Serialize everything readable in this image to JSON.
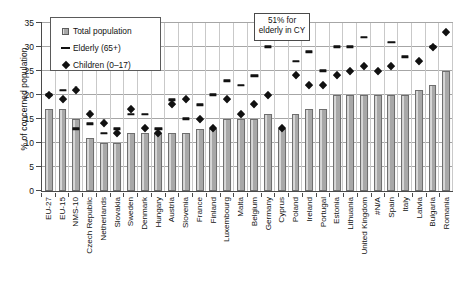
{
  "chart_data": {
    "type": "bar",
    "title": "",
    "xlabel": "",
    "ylabel": "% of concerned population",
    "ylim": [
      0,
      35
    ],
    "yticks": [
      0,
      5,
      10,
      15,
      20,
      25,
      30,
      35
    ],
    "grid": true,
    "legend_position": "top-left",
    "annotation": "51% for elderly in CY",
    "categories": [
      "EU-27",
      "EU-15",
      "NMS-10",
      "Czech Republic",
      "Netherlands",
      "Slovakia",
      "Sweden",
      "Denmark",
      "Hungary",
      "Austria",
      "Slovenia",
      "France",
      "Finland",
      "Luxembourg",
      "Malta",
      "Belgium",
      "Germany",
      "Cyprus",
      "Poland",
      "Ireland",
      "Portugal",
      "Estonia",
      "Lithuania",
      "United Kingdom",
      "#N/A",
      "Spain",
      "Italy",
      "Latvia",
      "Bulgaria",
      "Romania"
    ],
    "series": [
      {
        "name": "Total population",
        "marker": "bar",
        "values": [
          17,
          17,
          15,
          11,
          10,
          10,
          12,
          12,
          12,
          12,
          12,
          13,
          13,
          15,
          15,
          15,
          16,
          13,
          16,
          17,
          17,
          20,
          20,
          20,
          20,
          20,
          20,
          21,
          22,
          25
        ]
      },
      {
        "name": "Elderly (65+)",
        "marker": "dash",
        "values": [
          20,
          21,
          13,
          14,
          12,
          13,
          16,
          16,
          13,
          19,
          15,
          18,
          20,
          23,
          22,
          24,
          30,
          51,
          27,
          29,
          25,
          30,
          30,
          32,
          null,
          31,
          28,
          null,
          30,
          null
        ]
      },
      {
        "name": "Children (0–17)",
        "marker": "diamond",
        "values": [
          20,
          19,
          21,
          16,
          14,
          12,
          17,
          13,
          12,
          18,
          19,
          15,
          13,
          19,
          16,
          18,
          20,
          13,
          24,
          22,
          22,
          24,
          25,
          26,
          25,
          26,
          null,
          27,
          30,
          33
        ]
      }
    ]
  },
  "legend": {
    "items": [
      {
        "label": "Total population",
        "key": "bar-swatch"
      },
      {
        "label": "Elderly (65+)",
        "key": "dash-swatch"
      },
      {
        "label": "Children (0–17)",
        "key": "diamond-swatch"
      }
    ]
  },
  "colors": {
    "bar_fill": "#a8a8a8",
    "bar_stroke": "#6e6e6e",
    "marker": "#111111",
    "gridline": "#a6a6a6",
    "axis": "#4a4a4a",
    "background": "#ffffff"
  }
}
